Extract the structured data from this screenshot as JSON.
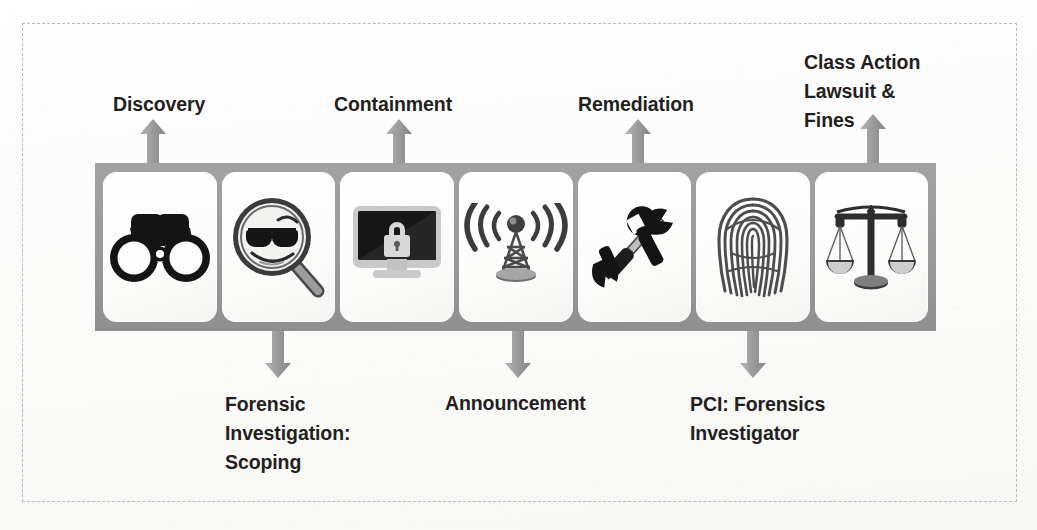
{
  "diagram": {
    "colors": {
      "bar": "#9a9a9a",
      "arrow": "#8e8e8e",
      "card": "#ffffff",
      "text": "#231f20",
      "frame": "#b9b9b9"
    },
    "cards": [
      {
        "icon": "binoculars-icon",
        "alt": "Binoculars"
      },
      {
        "icon": "magnifier-smiley-icon",
        "alt": "Magnifying glass over smiley face with sunglasses"
      },
      {
        "icon": "monitor-lock-icon",
        "alt": "Computer monitor with padlock"
      },
      {
        "icon": "broadcast-tower-icon",
        "alt": "Radio broadcast tower with signal waves"
      },
      {
        "icon": "wrench-screwdriver-icon",
        "alt": "Wrench and screwdriver"
      },
      {
        "icon": "fingerprint-icon",
        "alt": "Fingerprint"
      },
      {
        "icon": "scales-of-justice-icon",
        "alt": "Balance scales of justice"
      }
    ],
    "labels_above": [
      {
        "text": "Discovery",
        "arrow": "up-arrow-discovery"
      },
      {
        "text": "Containment",
        "arrow": "up-arrow-containment"
      },
      {
        "text": "Remediation",
        "arrow": "up-arrow-remediation"
      },
      {
        "text": "Class Action\nLawsuit &\nFines",
        "arrow": "up-arrow-class-action"
      }
    ],
    "labels_below": [
      {
        "text": "Forensic\nInvestigation:\nScoping",
        "arrow": "down-arrow-forensic"
      },
      {
        "text": "Announcement",
        "arrow": "down-arrow-announcement"
      },
      {
        "text": "PCI: Forensics\nInvestigator",
        "arrow": "down-arrow-pci"
      }
    ]
  }
}
